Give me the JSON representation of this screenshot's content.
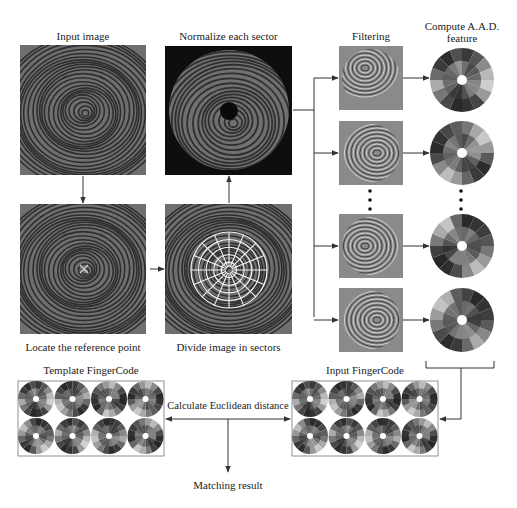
{
  "labels": {
    "input_image": "Input image",
    "normalize": "Normalize each sector",
    "filtering": "Filtering",
    "compute_aad_line1": "Compute A.A.D.",
    "compute_aad_line2": "feature",
    "locate": "Locate the reference point",
    "divide": "Divide image in sectors",
    "template_fingercode": "Template FingerCode",
    "input_fingercode": "Input FingerCode",
    "euclidean": "Calculate Euclidean distance",
    "matching_result": "Matching result"
  },
  "icons": {
    "reference_marker": "×",
    "ellipsis_dot": "•"
  },
  "colors": {
    "line": "#333333",
    "fingerprint_bg": "#6a6a6a",
    "ridge": "#2e2e2e",
    "normalize_bg": "#0e0e0e",
    "normalize_disk": "#6e6e6e",
    "filter_bg": "#8a8a8a",
    "grid": "#f2f2f2"
  },
  "filter_bank": {
    "count_shown": 4,
    "rows": [
      {
        "name": "filter-1",
        "aad_shades": [
          "#3a3a3a",
          "#555",
          "#8a8a8a",
          "#b8b8b8",
          "#cfcfcf",
          "#9a9a9a",
          "#444",
          "#333",
          "#2a2a2a",
          "#484848",
          "#777",
          "#aaa",
          "#6a6a6a",
          "#3c3c3c",
          "#2e2e2e",
          "#505050"
        ]
      },
      {
        "name": "filter-2",
        "aad_shades": [
          "#777",
          "#a8a8a8",
          "#c8c8c8",
          "#9a9a9a",
          "#5a5a5a",
          "#2c2c2c",
          "#3a3a3a",
          "#666",
          "#999",
          "#bcbcbc",
          "#8a8a8a",
          "#4a4a4a",
          "#2a2a2a",
          "#333",
          "#474747",
          "#5e5e5e"
        ]
      },
      {
        "name": "filter-3",
        "aad_shades": [
          "#2a2a2a",
          "#333",
          "#3c3c3c",
          "#555",
          "#777",
          "#9a9a9a",
          "#bbb",
          "#888",
          "#4c4c4c",
          "#2e2e2e",
          "#262626",
          "#404040",
          "#7a7a7a",
          "#aaa",
          "#c4c4c4",
          "#666"
        ]
      },
      {
        "name": "filter-4",
        "aad_shades": [
          "#444",
          "#2a2a2a",
          "#333",
          "#3e3e3e",
          "#5a5a5a",
          "#888",
          "#aaa",
          "#6a6a6a",
          "#3a3a3a",
          "#2c2c2c",
          "#4a4a4a",
          "#777",
          "#9c9c9c",
          "#c2c2c2",
          "#b0b0b0",
          "#5e5e5e"
        ]
      }
    ]
  },
  "fingercodes": {
    "template": {
      "rows": 2,
      "cols": 4
    },
    "input": {
      "rows": 2,
      "cols": 4
    }
  }
}
